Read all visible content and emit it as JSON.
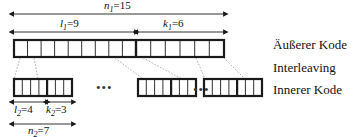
{
  "figure": {
    "background_color": "#ffffff",
    "line_color": "#1a1a1a",
    "dotted_color": "#9a9a9a"
  },
  "outer_code": {
    "total_label": {
      "symbol": "n",
      "sub": "1",
      "eq": "=15",
      "value": 15
    },
    "info_label": {
      "symbol": "l",
      "sub": "1",
      "eq": "=9",
      "value": 9
    },
    "parity_label": {
      "symbol": "k",
      "sub": "1",
      "eq": "=6",
      "value": 6
    },
    "info_cells": 9,
    "parity_cells": 6,
    "total_cells": 15
  },
  "inner_code": {
    "total_label": {
      "symbol": "n",
      "sub": "2",
      "eq": "=7",
      "value": 7
    },
    "info_label": {
      "symbol": "l",
      "sub": "2",
      "eq": "=4",
      "value": 4
    },
    "parity_label": {
      "symbol": "k",
      "sub": "2",
      "eq": "=3",
      "value": 3
    },
    "info_cells": 4,
    "parity_cells": 3,
    "total_cells": 7,
    "blocks_shown": 3,
    "ellipsis": "•••"
  },
  "side_labels": {
    "outer": "Äußerer Kode",
    "interleaving": "Interleaving",
    "inner": "Innerer Kode"
  }
}
